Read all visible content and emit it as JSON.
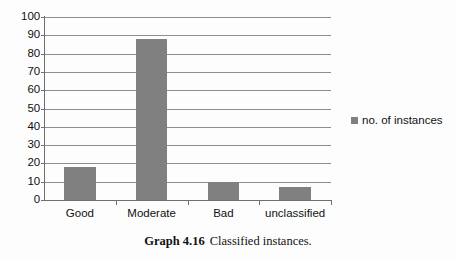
{
  "chart_data": {
    "type": "bar",
    "title": "",
    "xlabel": "",
    "ylabel": "",
    "categories": [
      "Good",
      "Moderate",
      "Bad",
      "unclassified"
    ],
    "values": [
      18,
      88,
      10,
      7
    ],
    "series": [
      {
        "name": "no. of instances",
        "values": [
          18,
          88,
          10,
          7
        ]
      }
    ],
    "ylim": [
      0,
      100
    ],
    "y_ticks": [
      0,
      10,
      20,
      30,
      40,
      50,
      60,
      70,
      80,
      90,
      100
    ],
    "grid": true,
    "legend_position": "right",
    "bar_color": "#808080",
    "axis_color": "#6f6f6f",
    "gridline_color": "#8d8d8d",
    "background_color": "#fdfdfd"
  },
  "legend": {
    "entries": [
      {
        "label": "no. of instances",
        "color": "#808080",
        "marker": "square-marker"
      }
    ]
  },
  "caption": {
    "label": "Graph 4.16",
    "text": "Classified instances."
  }
}
